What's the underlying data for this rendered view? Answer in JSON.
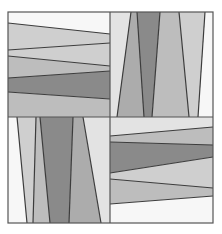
{
  "canvas": {
    "width": 222,
    "height": 234,
    "background": "#ffffff"
  },
  "frame": {
    "x": 8,
    "y": 12,
    "width": 205,
    "height": 211,
    "stroke": "#555555",
    "divider_x": 110,
    "divider_y": 117
  },
  "colors": {
    "white": "#f7f7f7",
    "lightest": "#e3e3e3",
    "light": "#cfcfcf",
    "mid_light": "#bdbdbd",
    "mid": "#acacac",
    "dark": "#8a8a8a",
    "line": "#3c3c3c"
  },
  "quadrants": [
    {
      "name": "top-left",
      "orientation": "horizontal",
      "box": [
        8,
        12,
        110,
        117
      ],
      "lines": [
        {
          "left": 23,
          "right": 34
        },
        {
          "left": 50,
          "right": 43
        },
        {
          "left": 56,
          "right": 66
        },
        {
          "left": 78,
          "right": 71
        },
        {
          "left": 92,
          "right": 99
        }
      ],
      "bands": [
        "white",
        "light",
        "light",
        "mid_light",
        "dark",
        "mid_light",
        "lightest"
      ]
    },
    {
      "name": "top-right",
      "orientation": "vertical",
      "box": [
        110,
        12,
        213,
        117
      ],
      "lines": [
        {
          "top": 131,
          "bottom": 117
        },
        {
          "top": 137,
          "bottom": 144
        },
        {
          "top": 160,
          "bottom": 152
        },
        {
          "top": 179,
          "bottom": 189
        },
        {
          "top": 205,
          "bottom": 198
        }
      ],
      "bands": [
        "lightest",
        "mid",
        "dark",
        "mid_light",
        "light",
        "white"
      ]
    },
    {
      "name": "bottom-left",
      "orientation": "vertical",
      "box": [
        8,
        117,
        110,
        223
      ],
      "lines": [
        {
          "top": 17,
          "bottom": 27
        },
        {
          "top": 36,
          "bottom": 33
        },
        {
          "top": 40,
          "bottom": 50
        },
        {
          "top": 73,
          "bottom": 69
        },
        {
          "top": 83,
          "bottom": 101
        }
      ],
      "bands": [
        "white",
        "light",
        "mid_light",
        "dark",
        "mid",
        "lightest"
      ]
    },
    {
      "name": "bottom-right",
      "orientation": "horizontal",
      "box": [
        110,
        117,
        213,
        223
      ],
      "lines": [
        {
          "left": 136,
          "right": 127
        },
        {
          "left": 142,
          "right": 145
        },
        {
          "left": 173,
          "right": 157
        },
        {
          "left": 179,
          "right": 188
        },
        {
          "left": 204,
          "right": 196
        }
      ],
      "bands": [
        "lightest",
        "mid_light",
        "dark",
        "light",
        "mid_light",
        "white"
      ]
    }
  ]
}
